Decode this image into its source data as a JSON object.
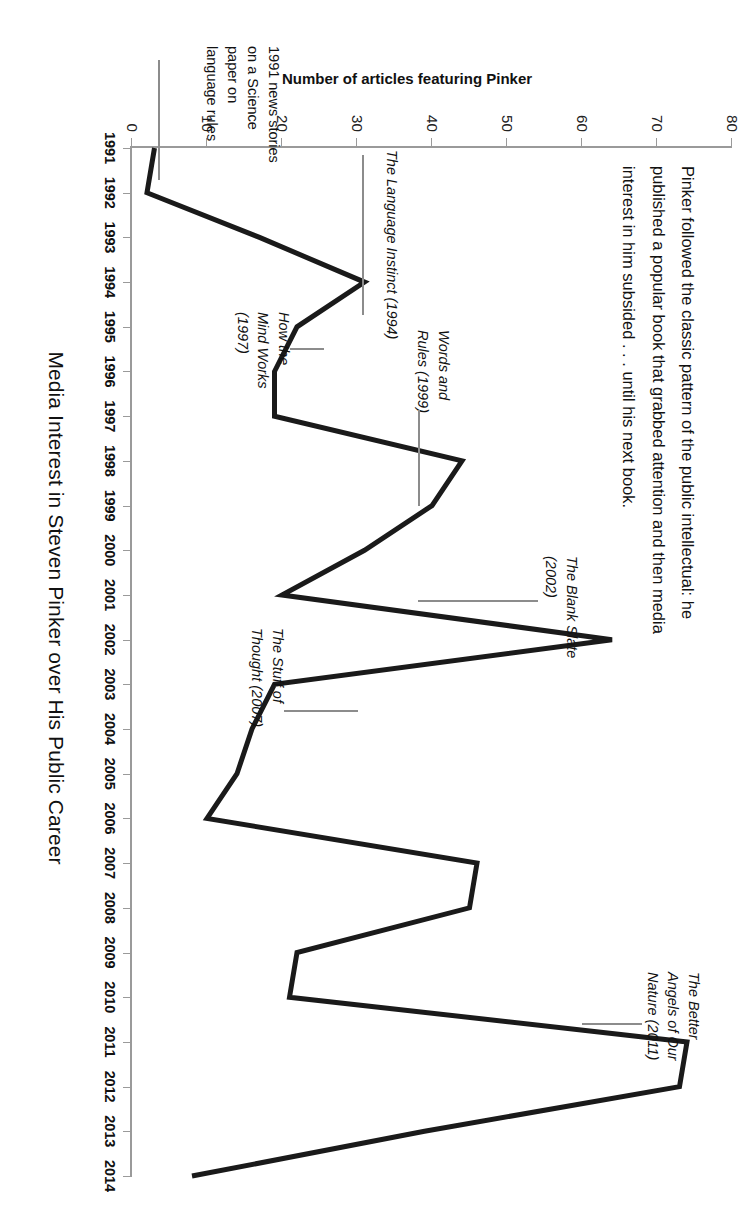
{
  "chart_data": {
    "type": "line",
    "title": "Media Interest in Steven Pinker over His Public Career",
    "xlabel": "Media Interest in Steven Pinker over His Public Career",
    "ylabel": "Number of articles featuring Pinker",
    "xlim": [
      1991,
      2014
    ],
    "ylim": [
      0,
      80
    ],
    "yticks": [
      0,
      10,
      20,
      30,
      40,
      50,
      60,
      70,
      80
    ],
    "grid": false,
    "legend": "none",
    "categories": [
      "1991",
      "1992",
      "1993",
      "1994",
      "1995",
      "1996",
      "1997",
      "1998",
      "1999",
      "2000",
      "2001",
      "2002",
      "2003",
      "2004",
      "2005",
      "2006",
      "2007",
      "2008",
      "2009",
      "2010",
      "2011",
      "2012",
      "2013",
      "2014"
    ],
    "values": [
      3,
      2,
      17,
      31,
      22,
      19,
      19,
      44,
      40,
      31,
      20,
      64,
      19,
      16,
      14,
      10,
      46,
      45,
      22,
      21,
      74,
      73,
      39,
      8
    ],
    "series": [
      {
        "name": "Number of articles featuring Pinker",
        "values": [
          3,
          2,
          17,
          31,
          22,
          19,
          19,
          44,
          40,
          31,
          20,
          64,
          19,
          16,
          14,
          10,
          46,
          45,
          22,
          21,
          74,
          73,
          39,
          8
        ]
      }
    ],
    "annotations": [
      {
        "id": "science-paper",
        "text": "1991 news stories\non a Science\npaper on\nlanguage rules",
        "italic_words": "Science",
        "target_year": 1991,
        "target_value": 3
      },
      {
        "id": "language-instinct",
        "text": "The Language Instinct (1994)",
        "target_year": 1994,
        "target_value": 31
      },
      {
        "id": "how-the-mind-works",
        "text": "How the\nMind Works\n(1997)",
        "target_year": 1997,
        "target_value": 19
      },
      {
        "id": "words-and-rules",
        "text": "Words and\nRules (1999)",
        "target_year": 1999,
        "target_value": 40
      },
      {
        "id": "blank-slate",
        "text": "The Blank Slate\n(2002)",
        "target_year": 2002,
        "target_value": 64
      },
      {
        "id": "stuff-of-thought",
        "text": "The Stuff of\nThought (2007)",
        "target_year": 2007,
        "target_value": 46
      },
      {
        "id": "better-angels",
        "text": "The Better\nAngels of Our\nNature (2011)",
        "target_year": 2011,
        "target_value": 74
      }
    ],
    "caption": "Pinker followed the classic pattern of the public intellectual: he published a popular book that grabbed attention and then media interest in him subsided . . . until his next book."
  },
  "figure": {
    "title": "Media Interest in Steven Pinker over His Public Career",
    "y_axis_title": "Number of articles featuring Pinker",
    "y_tick_labels": [
      "0",
      "10",
      "20",
      "30",
      "40",
      "50",
      "60",
      "70",
      "80"
    ],
    "x_tick_labels": [
      "1991",
      "1992",
      "1993",
      "1994",
      "1995",
      "1996",
      "1997",
      "1998",
      "1999",
      "2000",
      "2001",
      "2002",
      "2003",
      "2004",
      "2005",
      "2006",
      "2007",
      "2008",
      "2009",
      "2010",
      "2011",
      "2012",
      "2013",
      "2014"
    ],
    "caption": "Pinker followed the classic pattern of the public intellectual: he published a popular book that grabbed attention and then media interest in him subsided . . . until his next book.",
    "annotations": {
      "science_paper": "1991 news stories\non a Science\npaper on\nlanguage rules",
      "language_instinct": "The Language Instinct (1994)",
      "how_the_mind_works": "How the\nMind Works\n(1997)",
      "words_and_rules": "Words and\nRules (1999)",
      "blank_slate": "The Blank Slate\n(2002)",
      "stuff_of_thought": "The Stuff of\nThought (2007)",
      "better_angels": "The Better\nAngels of Our\nNature (2011)"
    },
    "colors": {
      "line": "#1a1a1a",
      "axis": "#9a9a9a",
      "text": "#111111",
      "leader": "#8c8c8c"
    }
  }
}
